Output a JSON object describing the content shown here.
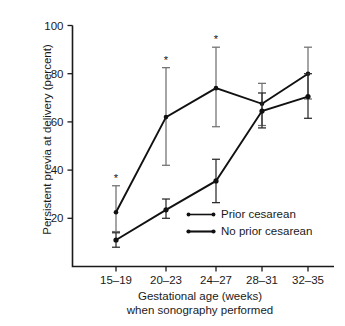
{
  "chart_data": {
    "type": "line",
    "title": "",
    "xlabel": "Gestational age (weeks)\nwhen sonography performed",
    "xlabel_line1": "Gestational age (weeks)",
    "xlabel_line2": "when sonography performed",
    "ylabel": "Persistent previa at delivery (percent)",
    "categories": [
      "15–19",
      "20–23",
      "24–27",
      "28–31",
      "32–35"
    ],
    "ylim": [
      0,
      100
    ],
    "xlim_note": "categorical, 5 groups",
    "yticks": [
      20,
      40,
      60,
      80,
      100
    ],
    "ytick_labels": [
      "20",
      "40",
      "60",
      "80",
      "100"
    ],
    "grid": false,
    "legend_position": "inside-lower-right",
    "annotation_symbol": "*",
    "annotation_note": "Asterisk marks first three 'Prior cesarean' points",
    "series": [
      {
        "name": "Prior cesarean",
        "values": [
          22.5,
          62,
          74,
          67.5,
          80
        ],
        "err_low": [
          14.5,
          42,
          58,
          58.5,
          69.5
        ],
        "err_high": [
          33.5,
          82.5,
          91,
          76,
          91
        ],
        "starred": [
          true,
          true,
          true,
          false,
          false
        ],
        "color": "#111111"
      },
      {
        "name": "No prior cesarean",
        "values": [
          11,
          23.5,
          35.5,
          64.5,
          70.5
        ],
        "err_low": [
          8,
          20,
          26.5,
          57.5,
          61.5
        ],
        "err_high": [
          14,
          28,
          44.5,
          72,
          80
        ],
        "starred": [
          false,
          false,
          false,
          false,
          false
        ],
        "color": "#111111"
      }
    ]
  },
  "legend": {
    "items": [
      {
        "label": "Prior cesarean"
      },
      {
        "label": "No prior cesarean"
      }
    ]
  }
}
